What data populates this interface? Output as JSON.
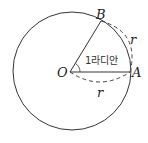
{
  "diagram": {
    "points": {
      "O": "O",
      "A": "A",
      "B": "B"
    },
    "radius_label_bottom": "r",
    "arc_label": "r",
    "angle_label": "1라디안",
    "colors": {
      "stroke": "#333333",
      "background": "#ffffff"
    }
  }
}
